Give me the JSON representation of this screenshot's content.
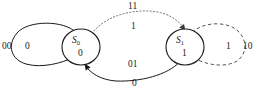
{
  "diagram": {
    "colors": {
      "solid_edge": "#1a1a1a",
      "dotted_edge": "#777777",
      "dashed_edge": "#555555",
      "node_stroke": "#1a1a1a",
      "background": "#ffffff"
    },
    "states": [
      {
        "id": "S0",
        "name": "S",
        "subscript": "0",
        "output": "0",
        "cx": 81,
        "cy": 47,
        "rx": 19,
        "ry": 18
      },
      {
        "id": "S1",
        "name": "S",
        "subscript": "1",
        "output": "1",
        "cx": 185,
        "cy": 47,
        "rx": 19,
        "ry": 18
      }
    ],
    "transitions": [
      {
        "id": "s0-self",
        "from": "S0",
        "to": "S0",
        "style": "solid",
        "outer_label": "00",
        "inner_label": "0",
        "description": "self-loop on S0 for input 00"
      },
      {
        "id": "s0-to-s1",
        "from": "S0",
        "to": "S1",
        "style": "dotted",
        "outer_label": "11",
        "inner_label": "1",
        "description": "top dotted arc from S0 to S1 for input 11"
      },
      {
        "id": "s1-to-s0",
        "from": "S1",
        "to": "S0",
        "style": "solid",
        "outer_label": "01",
        "inner_label": "0",
        "description": "bottom solid arc from S1 to S0 for input 01"
      },
      {
        "id": "s1-self",
        "from": "S1",
        "to": "S1",
        "style": "dashed",
        "outer_label": "10",
        "inner_label": "1",
        "description": "self-loop on S1 for input 10"
      }
    ]
  },
  "labels": {
    "left_loop_outer": "00",
    "left_loop_inner": "0",
    "top_arc_outer": "11",
    "top_arc_inner": "1",
    "bottom_arc_outer": "01",
    "bottom_arc_inner": "0",
    "right_loop_inner": "1",
    "right_loop_outer": "10",
    "s0_name": "S",
    "s0_sub": "0",
    "s0_output": "0",
    "s1_name": "S",
    "s1_sub": "1",
    "s1_output": "1"
  }
}
